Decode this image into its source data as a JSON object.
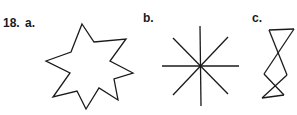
{
  "problem": {
    "number": "18.",
    "parts": [
      {
        "label": "a.",
        "figure": "seven-pointed-star"
      },
      {
        "label": "b.",
        "figure": "eight-ray-asterisk"
      },
      {
        "label": "c.",
        "figure": "zigzag-hourglass"
      }
    ]
  },
  "colors": {
    "stroke": "#1a1a1a",
    "background": "#ffffff"
  }
}
